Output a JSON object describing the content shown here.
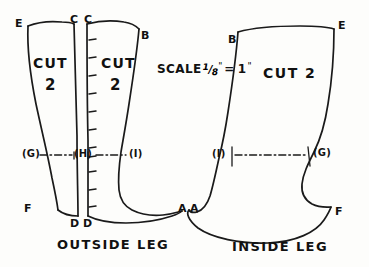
{
  "document": {
    "type": "hand-drawn sewing pattern diagram",
    "subject": "boot leg pattern pieces"
  },
  "scale": {
    "prefix": "SCALE",
    "numerator": "1",
    "slash": "/",
    "denominator": "8",
    "inch_mark_left": "\"",
    "equals": "=",
    "value": "1",
    "inch_mark_right": "\"",
    "full_text": "SCALE 1/8\" = 1\""
  },
  "captions": {
    "left": "OUTSIDE LEG",
    "right": "INSIDE LEG"
  },
  "pieces": [
    {
      "id": "outside-left",
      "cut_label": "CUT",
      "cut_count": "2",
      "corner_labels": [
        "E",
        "C"
      ],
      "hem_labels": [
        "F",
        "D"
      ]
    },
    {
      "id": "outside-right",
      "cut_label": "CUT",
      "cut_count": "2",
      "corner_labels": [
        "C",
        "B"
      ],
      "hem_labels": [
        "D",
        "A"
      ]
    },
    {
      "id": "inside",
      "cut_label": "CUT 2",
      "corner_labels": [
        "B",
        "E"
      ],
      "hem_labels": [
        "A",
        "F"
      ]
    }
  ],
  "labels": {
    "E_left": "E",
    "C_left": "C",
    "C_right": "C",
    "B_left": "B",
    "B_inside": "B",
    "E_inside": "E",
    "F_left": "F",
    "D_left": "D",
    "D_right": "D",
    "A_left": "A",
    "A_right": "A",
    "F_inside": "F",
    "G_outside": "(G)",
    "H_outside": "(H)",
    "I_outside": "(I)",
    "I_inside": "(I)",
    "G_inside": "(G)"
  },
  "cut_text": {
    "cut": "CUT",
    "two": "2",
    "cut_two": "CUT 2"
  },
  "colors": {
    "ink": "#1a1a1a",
    "paper": "#fdfdfb"
  },
  "tick_marks": {
    "count": 11,
    "description": "seam allowance tick marks along inner edge of right outside-leg piece"
  }
}
